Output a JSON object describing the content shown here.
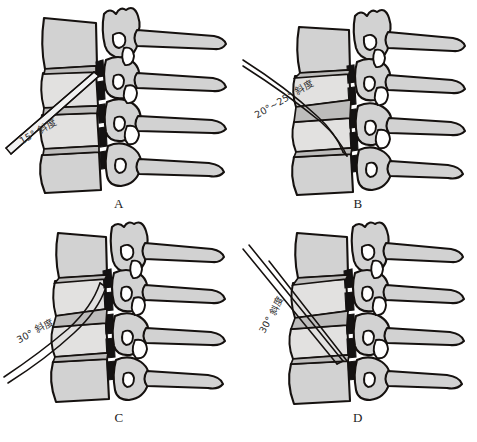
{
  "figure": {
    "background_color": "#ffffff",
    "bone_fill_color": "#d2d2d2",
    "outline_color": "#15110f",
    "canal_color": "#141212",
    "layout": "2x2 grid of lateral cervical spine illustrations"
  },
  "panels": [
    {
      "id": "A",
      "caption": "A",
      "angle_label": "15° 斜度",
      "angle_degrees": 15,
      "instrument": "straight double-line probe, shallow oblique from lower-left",
      "vertebra_count": 4
    },
    {
      "id": "B",
      "caption": "B",
      "angle_label": "20°~25° 斜度",
      "angle_degrees": "20-25",
      "instrument": "curved double-line probe, oblique from upper-left curving caudally",
      "vertebra_count": 4
    },
    {
      "id": "C",
      "caption": "C",
      "angle_label": "30° 斜度",
      "angle_degrees": 30,
      "instrument": "curved double-line probe entering at 30 degrees",
      "vertebra_count": 4
    },
    {
      "id": "D",
      "caption": "D",
      "angle_label": "30° 斜度",
      "angle_degrees": 30,
      "instrument": "straight rigid instrument at steep descent to lower disc space",
      "vertebra_count": 4
    }
  ]
}
